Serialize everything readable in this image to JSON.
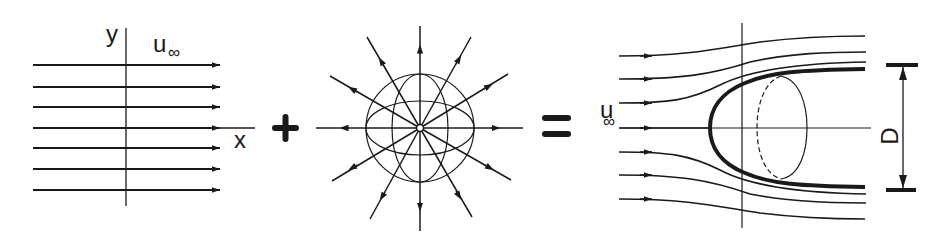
{
  "figure": {
    "panels": [
      {
        "id": "uniform-flow",
        "labels": {
          "y_axis": "y",
          "x_axis": "x",
          "velocity": "u",
          "velocity_sub": "∞"
        },
        "streamline_count": 7
      },
      {
        "id": "point-source",
        "radial_line_count": 12
      },
      {
        "id": "half-body",
        "labels": {
          "velocity": "u",
          "velocity_sub": "∞",
          "dimension": "D"
        },
        "streamline_count": 7
      }
    ],
    "operators": {
      "plus": "+",
      "equals": "="
    },
    "colors": {
      "ink": "#1a1a1a",
      "background": "#ffffff"
    }
  }
}
